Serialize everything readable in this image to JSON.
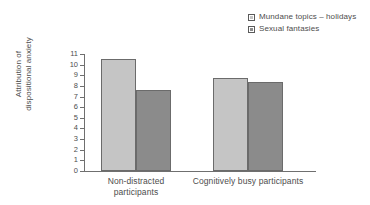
{
  "chart_data": {
    "type": "bar",
    "title": "",
    "xlabel": "",
    "ylabel_line1": "Attribution of",
    "ylabel_line2": "dispositional anxiety",
    "categories": [
      "Non-distracted participants",
      "Cognitively busy participants"
    ],
    "category_lines": [
      [
        "Non-distracted",
        "participants"
      ],
      [
        "Cognitively busy participants"
      ]
    ],
    "series": [
      {
        "name": "Mundane topics – holidays",
        "values": [
          10.5,
          8.7
        ],
        "color": "#c5c5c5"
      },
      {
        "name": "Sexual fantasies",
        "values": [
          7.6,
          8.4
        ],
        "color": "#8b8b8b"
      }
    ],
    "ylim": [
      0,
      11
    ],
    "yticks": [
      0,
      1,
      2,
      3,
      4,
      5,
      6,
      7,
      8,
      9,
      10,
      11
    ],
    "ytick_labels": [
      "0",
      "1",
      "2",
      "3",
      "4",
      "5",
      "6",
      "7",
      "8",
      "9",
      "10",
      "11"
    ],
    "grid": false,
    "legend_position": "top-right"
  },
  "legend": {
    "items": [
      {
        "label": "Mundane topics – holidays",
        "swatch": "light-gray-swatch"
      },
      {
        "label": "Sexual fantasies",
        "swatch": "dark-gray-swatch"
      }
    ]
  },
  "colors": {
    "series_light": "#c5c5c5",
    "series_dark": "#8b8b8b",
    "axis": "#6f6f6f",
    "text": "#4d4d4d",
    "bar_border": "#6b6b6b",
    "background": "#ffffff"
  }
}
